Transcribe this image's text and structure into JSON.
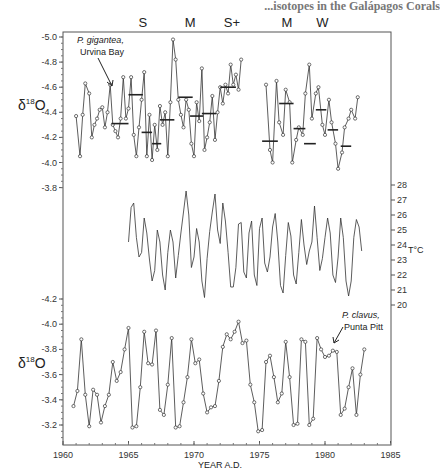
{
  "running_head": "...isotopes in the Galápagos Corals",
  "chart_data": [
    {
      "type": "line",
      "title": "P. gigantea, Urvina Bay",
      "panel": "top",
      "ylabel": "δ18O",
      "ylim": [
        -5.0,
        -3.8
      ],
      "y_inverted": true,
      "yticks": [
        "-5.0",
        "-4.8",
        "-4.6",
        "-4.4",
        "-4.2",
        "-4.0",
        "-3.8"
      ],
      "annotation": [
        "P. gigantea,",
        "Urvina Bay"
      ],
      "event_labels": [
        {
          "label": "S",
          "year": 1966.1
        },
        {
          "label": "M",
          "year": 1969.7
        },
        {
          "label": "S+",
          "year": 1972.9
        },
        {
          "label": "M",
          "year": 1977.1
        },
        {
          "label": "W",
          "year": 1979.8
        }
      ],
      "x": [
        1961.0,
        1961.3,
        1961.5,
        1961.7,
        1962.0,
        1962.2,
        1962.4,
        1962.6,
        1962.8,
        1963.0,
        1963.2,
        1963.4,
        1963.6,
        1963.8,
        1964.0,
        1964.2,
        1964.4,
        1964.6,
        1964.8,
        1965.0,
        1965.2,
        1965.4,
        1965.6,
        1965.8,
        1966.0,
        1966.2,
        1966.4,
        1966.6,
        1966.8,
        1967.0,
        1967.2,
        1967.4,
        1967.6,
        1967.8,
        1968.0,
        1968.2,
        1968.4,
        1968.6,
        1968.8,
        1969.0,
        1969.2,
        1969.4,
        1969.6,
        1969.8,
        1970.0,
        1970.2,
        1970.4,
        1970.6,
        1970.8,
        1971.0,
        1971.2,
        1971.4,
        1971.6,
        1971.8,
        1972.0,
        1972.2,
        1972.4,
        1972.6,
        1972.8,
        1973.0,
        1973.2,
        1973.4,
        1973.6
      ],
      "values": [
        -4.37,
        -4.05,
        -4.38,
        -4.63,
        -4.55,
        -4.2,
        -4.3,
        -4.35,
        -4.42,
        -4.44,
        -4.28,
        -4.4,
        -4.62,
        -4.3,
        -4.25,
        -4.2,
        -4.35,
        -4.68,
        -4.35,
        -4.43,
        -4.68,
        -4.22,
        -4.05,
        -4.28,
        -4.5,
        -4.72,
        -4.05,
        -4.38,
        -4.02,
        -4.3,
        -4.1,
        -4.45,
        -4.3,
        -4.4,
        -4.05,
        -4.48,
        -4.98,
        -4.82,
        -4.5,
        -4.38,
        -4.28,
        -4.5,
        -4.42,
        -4.15,
        -4.05,
        -4.48,
        -4.33,
        -4.75,
        -4.1,
        -4.2,
        -4.32,
        -4.53,
        -4.18,
        -4.4,
        -4.6,
        -4.47,
        -4.62,
        -4.55,
        -4.78,
        -4.62,
        -4.7,
        -4.58,
        -4.82
      ],
      "x2": [
        1975.5,
        1975.8,
        1976.0,
        1976.3,
        1976.5,
        1976.8,
        1977.0,
        1977.3,
        1977.5,
        1977.8,
        1978.0,
        1978.3,
        1978.5,
        1978.8,
        1979.0,
        1979.3,
        1979.5,
        1979.8,
        1980.0,
        1980.3,
        1980.5,
        1980.8,
        1981.0,
        1981.3,
        1981.5,
        1981.8,
        1982.0,
        1982.3,
        1982.5
      ],
      "values2": [
        -4.62,
        -4.1,
        -4.0,
        -4.65,
        -4.32,
        -4.22,
        -4.58,
        -4.48,
        -4.0,
        -4.18,
        -4.28,
        -4.22,
        -4.55,
        -4.78,
        -4.35,
        -4.55,
        -4.6,
        -4.3,
        -4.22,
        -4.5,
        -4.32,
        -4.15,
        -3.95,
        -4.08,
        -4.28,
        -4.35,
        -4.42,
        -4.35,
        -4.52
      ],
      "means": [
        {
          "x0": 1963.7,
          "x1": 1965.0,
          "y": -4.31
        },
        {
          "x0": 1965.0,
          "x1": 1966.1,
          "y": -4.54
        },
        {
          "x0": 1966.0,
          "x1": 1966.8,
          "y": -4.24
        },
        {
          "x0": 1966.8,
          "x1": 1967.5,
          "y": -4.15
        },
        {
          "x0": 1967.4,
          "x1": 1968.5,
          "y": -4.34
        },
        {
          "x0": 1968.8,
          "x1": 1969.9,
          "y": -4.52
        },
        {
          "x0": 1969.7,
          "x1": 1970.7,
          "y": -4.37
        },
        {
          "x0": 1970.6,
          "x1": 1971.7,
          "y": -4.39
        },
        {
          "x0": 1972.0,
          "x1": 1973.2,
          "y": -4.6
        },
        {
          "x0": 1975.2,
          "x1": 1976.4,
          "y": -4.17
        },
        {
          "x0": 1976.5,
          "x1": 1977.6,
          "y": -4.47
        },
        {
          "x0": 1977.6,
          "x1": 1978.5,
          "y": -4.27
        },
        {
          "x0": 1978.4,
          "x1": 1979.3,
          "y": -4.15
        },
        {
          "x0": 1979.3,
          "x1": 1980.1,
          "y": -4.42
        },
        {
          "x0": 1980.2,
          "x1": 1981.0,
          "y": -4.26
        },
        {
          "x0": 1981.2,
          "x1": 1982.0,
          "y": -4.13
        }
      ]
    },
    {
      "type": "line",
      "title": "Sea surface temperature",
      "panel": "middle",
      "ylabel": "T°C",
      "ylim": [
        20,
        28
      ],
      "yticks": [
        "28",
        "27",
        "26",
        "25",
        "24",
        "23",
        "22",
        "21",
        "20"
      ],
      "x": [
        1965.0,
        1965.2,
        1965.4,
        1965.6,
        1965.8,
        1966.0,
        1966.2,
        1966.4,
        1966.6,
        1966.8,
        1967.0,
        1967.2,
        1967.4,
        1967.6,
        1967.8,
        1968.0,
        1968.2,
        1968.4,
        1968.6,
        1968.8,
        1969.0,
        1969.2,
        1969.4,
        1969.6,
        1969.8,
        1970.0,
        1970.2,
        1970.4,
        1970.6,
        1970.8,
        1971.0,
        1971.2,
        1971.4,
        1971.6,
        1971.8,
        1972.0,
        1972.2,
        1972.4,
        1972.6,
        1972.8,
        1973.0,
        1973.2,
        1973.4,
        1973.6,
        1973.8,
        1974.0,
        1974.2,
        1974.4,
        1974.6,
        1974.8,
        1975.0,
        1975.2,
        1975.4,
        1975.6,
        1975.8,
        1976.0,
        1976.2,
        1976.4,
        1976.6,
        1976.8,
        1977.0,
        1977.2,
        1977.4,
        1977.6,
        1977.8,
        1978.0,
        1978.2,
        1978.4,
        1978.6,
        1978.8,
        1979.0,
        1979.2,
        1979.4,
        1979.6,
        1979.8,
        1980.0,
        1980.2,
        1980.4,
        1980.6,
        1980.8,
        1981.0,
        1981.2,
        1981.4,
        1981.6,
        1981.8,
        1982.0,
        1982.2,
        1982.4,
        1982.6,
        1982.8
      ],
      "values": [
        24.2,
        26.5,
        26.8,
        24.5,
        23.2,
        23.5,
        25.8,
        24.8,
        23.0,
        21.6,
        22.3,
        25.0,
        24.2,
        22.0,
        21.0,
        23.5,
        25.0,
        24.2,
        21.8,
        23.3,
        24.8,
        26.2,
        27.6,
        26.0,
        22.5,
        23.2,
        25.1,
        24.2,
        21.6,
        20.5,
        23.1,
        24.9,
        26.2,
        27.4,
        25.0,
        24.1,
        26.8,
        25.6,
        23.5,
        21.2,
        21.2,
        22.5,
        25.4,
        25.5,
        22.2,
        21.8,
        24.8,
        25.6,
        22.0,
        21.3,
        25.1,
        25.8,
        22.8,
        22.2,
        23.2,
        25.2,
        26.1,
        24.2,
        21.3,
        20.8,
        23.3,
        25.5,
        24.6,
        22.0,
        21.4,
        23.5,
        25.7,
        24.0,
        22.7,
        23.6,
        24.2,
        26.6,
        24.5,
        22.3,
        23.1,
        24.5,
        25.8,
        24.8,
        22.0,
        21.5,
        23.2,
        25.8,
        24.5,
        21.6,
        20.6,
        21.6,
        24.5,
        25.7,
        25.2,
        23.6
      ]
    },
    {
      "type": "line",
      "title": "P. clavus, Punta Pitt",
      "panel": "bottom",
      "ylabel": "δ18O",
      "xlabel": "YEAR A.D.",
      "ylim": [
        -4.2,
        -3.1
      ],
      "y_inverted": true,
      "yticks": [
        "-4.2",
        "-4.0",
        "-3.8",
        "-3.6",
        "-3.4",
        "-3.2"
      ],
      "xticks": [
        "1960",
        "1965",
        "1970",
        "1975",
        "1980",
        "1985"
      ],
      "xlim": [
        1960,
        1985
      ],
      "annotation": [
        "P. clavus,",
        "Punta Pitt"
      ],
      "x": [
        1960.8,
        1961.1,
        1961.4,
        1961.7,
        1962.0,
        1962.3,
        1962.6,
        1962.9,
        1963.2,
        1963.5,
        1963.8,
        1964.1,
        1964.4,
        1964.7,
        1965.0,
        1965.3,
        1965.6,
        1965.9,
        1966.2,
        1966.5,
        1966.8,
        1967.1,
        1967.4,
        1967.7,
        1968.0,
        1968.3,
        1968.6,
        1968.9,
        1969.2,
        1969.5,
        1969.8,
        1970.1,
        1970.4,
        1970.7,
        1971.0,
        1971.3,
        1971.6,
        1971.9,
        1972.2,
        1972.5,
        1972.8,
        1973.1,
        1973.4,
        1973.7,
        1974.0,
        1974.3,
        1974.6,
        1974.9,
        1975.2,
        1975.5,
        1975.8,
        1976.1,
        1976.4,
        1976.7,
        1977.0,
        1977.3,
        1977.6,
        1977.9,
        1978.2,
        1978.5,
        1978.8,
        1979.1,
        1979.4,
        1979.7,
        1980.0,
        1980.3,
        1980.6,
        1980.9,
        1981.2,
        1981.5,
        1981.8,
        1982.1,
        1982.4,
        1982.7,
        1983.0
      ],
      "values": [
        -3.35,
        -3.47,
        -3.88,
        -3.44,
        -3.19,
        -3.48,
        -3.44,
        -3.22,
        -3.35,
        -3.44,
        -3.7,
        -3.55,
        -3.62,
        -3.8,
        -3.97,
        -3.18,
        -3.19,
        -3.5,
        -3.94,
        -3.69,
        -3.68,
        -3.95,
        -3.32,
        -3.28,
        -3.52,
        -3.89,
        -3.18,
        -3.19,
        -3.38,
        -3.58,
        -3.88,
        -3.69,
        -3.72,
        -3.45,
        -3.3,
        -3.34,
        -3.35,
        -3.55,
        -3.82,
        -3.92,
        -3.88,
        -3.94,
        -4.02,
        -3.85,
        -3.87,
        -3.52,
        -3.38,
        -3.15,
        -3.16,
        -3.7,
        -3.75,
        -3.58,
        -3.38,
        -3.45,
        -3.86,
        -3.58,
        -3.2,
        -3.21,
        -3.88,
        -3.86,
        -3.2,
        -3.25,
        -3.89,
        -3.8,
        -3.74,
        -3.75,
        -3.79,
        -3.78,
        -3.28,
        -3.33,
        -3.5,
        -3.65,
        -3.28,
        -3.6,
        -3.8,
        -3.72,
        -3.78
      ]
    }
  ]
}
